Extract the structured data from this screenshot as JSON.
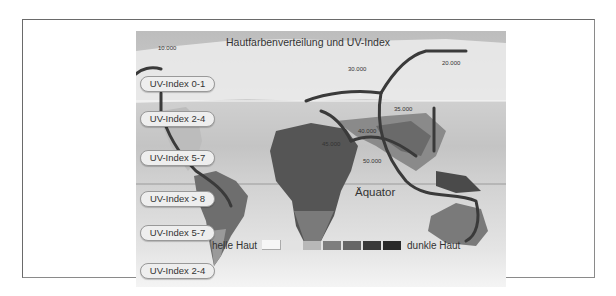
{
  "figure": {
    "title": "Hautfarbenverteilung und UV-Index",
    "equator_label": "Äquator",
    "uv_bands": [
      {
        "label": "UV-Index 0-1"
      },
      {
        "label": "UV-Index 2-4"
      },
      {
        "label": "UV-Index 5-7"
      },
      {
        "label": "UV-Index > 8"
      },
      {
        "label": "UV-Index 5-7"
      },
      {
        "label": "UV-Index 2-4"
      }
    ],
    "migration_years": [
      "10.000",
      "30.000",
      "20.000",
      "35.000",
      "40.000",
      "45.000",
      "50.000"
    ],
    "legend": {
      "left_label": "helle Haut",
      "right_label": "dunkle Haut",
      "swatches": [
        "#f6f6f6",
        "#e2e2e2",
        "#b8b8b8",
        "#7e7e7e",
        "#666666",
        "#3a3a3a",
        "#2a2a2a"
      ]
    }
  }
}
